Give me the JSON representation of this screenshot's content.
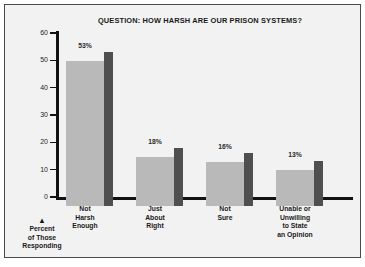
{
  "chart_data": {
    "type": "bar",
    "title": "QUESTION: HOW HARSH ARE OUR PRISON SYSTEMS?",
    "xlabel": "",
    "ylabel": "Percent of Those Responding",
    "ylim": [
      0,
      60
    ],
    "yticks": [
      0,
      10,
      20,
      30,
      40,
      50,
      60
    ],
    "ytick_labels": [
      "0",
      "10",
      "20",
      "30",
      "40",
      "50",
      "60"
    ],
    "grid": false,
    "legend": false,
    "categories": [
      "Not\nHarsh\nEnough",
      "Just\nAbout\nRight",
      "Not\nSure",
      "Unable or\nUnwilling\nto State\nan Opinion"
    ],
    "category_labels": [
      [
        "Not",
        "Harsh",
        "Enough"
      ],
      [
        "Just",
        "About",
        "Right"
      ],
      [
        "Not",
        "Sure"
      ],
      [
        "Unable or",
        "Unwilling",
        "to State",
        "an Opinion"
      ]
    ],
    "values": [
      53,
      18,
      16,
      13
    ],
    "data_labels": [
      "53%",
      "18%",
      "16%",
      "13%"
    ],
    "style": "3d-bar",
    "colors": {
      "bar_front": "#b9b9b9",
      "bar_side": "#4f4f4f",
      "axis": "#111111",
      "background": "#f2f2f2",
      "border": "#4a4a4a",
      "text": "#1a1a1a"
    }
  },
  "axis_caption": {
    "marker": "▲",
    "lines": [
      "Percent",
      "of Those",
      "Responding"
    ]
  }
}
